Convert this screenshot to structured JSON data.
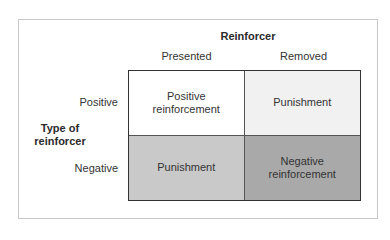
{
  "diagram": {
    "title": "Reinforcer",
    "columns": [
      "Presented",
      "Removed"
    ],
    "rows": [
      "Positive",
      "Negative"
    ],
    "row_axis_label": "Type of reinforcer",
    "cells": [
      {
        "label": "Positive reinforcement",
        "color": "#ffffff"
      },
      {
        "label": "Punishment",
        "color": "#f1f1f1"
      },
      {
        "label": "Punishment",
        "color": "#c9c9c9"
      },
      {
        "label": "Negative reinforcement",
        "color": "#a9a9a9"
      }
    ]
  }
}
